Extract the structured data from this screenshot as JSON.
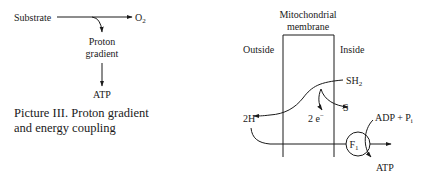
{
  "left_diagram": {
    "substrate": "Substrate",
    "oxygen": "O",
    "oxygen_sub": "2",
    "proton_line1": "Proton",
    "proton_line2": "gradient",
    "atp": "ATP",
    "caption_line1": "Picture III. Proton gradient",
    "caption_line2": "and energy coupling"
  },
  "right_diagram": {
    "membrane_line1": "Mitochondrial",
    "membrane_line2": "membrane",
    "outside": "Outside",
    "inside": "Inside",
    "sh": "SH",
    "sh_sub": "2",
    "s": "S",
    "electrons": "2 e",
    "electrons_sup": "−",
    "protons": "2H",
    "protons_sup": "+",
    "adp": "ADP + P",
    "adp_sub": "i",
    "f1": "F",
    "f1_sub": "1",
    "atp": "ATP"
  }
}
